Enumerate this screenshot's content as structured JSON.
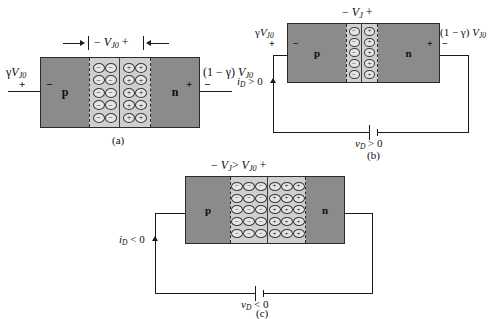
{
  "figure": {
    "title_absent": true,
    "panels": [
      {
        "id": "a",
        "caption": "(a)",
        "junction_label": {
          "minus": "−",
          "symbol": "V",
          "subscript": "J0",
          "plus": "+",
          "full": "− V_J0 +"
        },
        "left_terminal_label": {
          "full": "γ V_J0",
          "gamma": "γ",
          "symbol": "V",
          "subscript": "J0"
        },
        "left_terminal_signs": {
          "outer": "+",
          "inner": "−"
        },
        "right_terminal_label": {
          "full": "(1 − γ) V_J0",
          "prefix": "(1 − γ)",
          "symbol": "V",
          "subscript": "J0"
        },
        "right_terminal_signs": {
          "inner": "+",
          "outer": "−"
        },
        "p_region": "p",
        "n_region": "n",
        "depletion_columns_per_side": 2,
        "depletion_rows": 5,
        "negative_charge": "−",
        "positive_charge": "+",
        "has_circuit": false
      },
      {
        "id": "b",
        "caption": "(b)",
        "junction_label": {
          "minus": "−",
          "symbol": "V",
          "subscript": "J",
          "plus": "+",
          "full": "− V_J +"
        },
        "left_terminal_label": {
          "full": "γ V_J0",
          "gamma": "γ",
          "symbol": "V",
          "subscript": "J0"
        },
        "left_terminal_signs": {
          "outer": "+",
          "inner": "−"
        },
        "right_terminal_label": {
          "full": "(1 − γ) V_J0",
          "prefix": "(1 − γ)",
          "symbol": "V",
          "subscript": "J0"
        },
        "right_terminal_signs": {
          "inner": "+",
          "outer": "−"
        },
        "p_region": "p",
        "n_region": "n",
        "depletion_columns_per_side": 1,
        "depletion_rows": 5,
        "negative_charge": "−",
        "positive_charge": "+",
        "has_circuit": true,
        "current_label": {
          "symbol": "i",
          "subscript": "D",
          "relation": "> 0",
          "full": "i_D > 0"
        },
        "source_label": {
          "symbol": "v",
          "subscript": "D",
          "relation": "> 0",
          "full": "v_D > 0"
        }
      },
      {
        "id": "c",
        "caption": "(c)",
        "junction_label": {
          "minus": "−",
          "symbol": "V",
          "subscript": "J",
          "relation": ">",
          "symbol2": "V",
          "subscript2": "J0",
          "plus": "+",
          "full": "− V_J > V_J0 +"
        },
        "p_region": "p",
        "n_region": "n",
        "depletion_columns_per_side": 3,
        "depletion_rows": 5,
        "negative_charge": "−",
        "positive_charge": "+",
        "has_circuit": true,
        "current_label": {
          "symbol": "i",
          "subscript": "D",
          "relation": "< 0",
          "full": "i_D < 0"
        },
        "source_label": {
          "symbol": "v",
          "subscript": "D",
          "relation": "< 0",
          "full": "v_D < 0"
        }
      }
    ],
    "colors": {
      "background": "#ffffff",
      "semiconductor_fill": "#8b8b8b",
      "depletion_fill": "#cfcfcf",
      "charge_fill": "#e6e6e6",
      "stroke": "#1a1a1a"
    }
  }
}
